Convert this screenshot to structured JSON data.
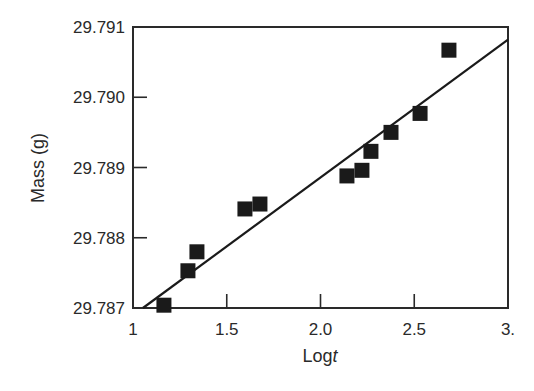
{
  "chart_data": {
    "type": "scatter",
    "title": "",
    "xlabel": "Logt",
    "xlabel_base": "Log",
    "xlabel_italic": "t",
    "ylabel": "Mass (g)",
    "xlim": [
      1.0,
      3.0
    ],
    "ylim": [
      29.787,
      29.791
    ],
    "x_ticks": [
      1.0,
      1.5,
      2.0,
      2.5,
      3.0
    ],
    "x_tick_labels": [
      "1",
      "1.5",
      "2.0",
      "2.5",
      "3."
    ],
    "y_ticks": [
      29.787,
      29.788,
      29.789,
      29.79,
      29.791
    ],
    "y_tick_labels": [
      "29.787",
      "29.788",
      "29.789",
      "29.790",
      "29.791"
    ],
    "grid": false,
    "legend": null,
    "series": [
      {
        "name": "Measured mass",
        "marker": "square",
        "color": "#1a1a1a",
        "x": [
          1.165,
          1.293,
          1.341,
          1.597,
          1.677,
          2.141,
          2.221,
          2.269,
          2.376,
          2.531,
          2.685
        ],
        "y": [
          29.78704,
          29.78753,
          29.7878,
          29.78841,
          29.78848,
          29.78888,
          29.78896,
          29.78923,
          29.7895,
          29.78977,
          29.79067
        ]
      },
      {
        "name": "Linear fit",
        "type": "line",
        "color": "#1a1a1a",
        "x": [
          1.053,
          3.0
        ],
        "y": [
          29.787,
          29.79082
        ]
      }
    ]
  }
}
